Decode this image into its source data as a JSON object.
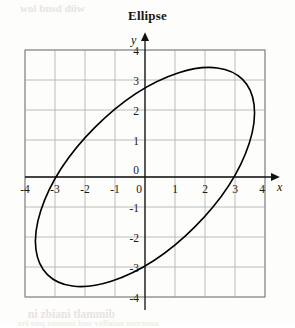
{
  "figure": {
    "title": "Ellipse",
    "background_color": "#fdfdfb",
    "bleed_text_top": "wol bnsd diiw",
    "bleed_text_bottom": "ni zbiani tlammib",
    "bleed_text_bottom2": "eri enq zuomez hne vellaine mernma"
  },
  "chart_data": {
    "type": "line",
    "title": "Ellipse",
    "xlabel": "x",
    "ylabel": "y",
    "xlim": [
      -4,
      4
    ],
    "ylim": [
      -4,
      4
    ],
    "grid": true,
    "grid_step": 1,
    "legend": "none",
    "axis_arrows": true,
    "xticks": [
      -4,
      -3,
      -2,
      -1,
      0,
      1,
      2,
      3,
      4
    ],
    "xtick_labels": [
      "-4",
      "-3",
      "-2",
      "-1",
      "0",
      "1",
      "2",
      "3",
      "4"
    ],
    "yticks": [
      -4,
      -3,
      -2,
      -1,
      0,
      1,
      2,
      3,
      4
    ],
    "ytick_labels": [
      "-4",
      "-3",
      "-2",
      "-1",
      "0",
      "1",
      "2",
      "3",
      "4"
    ],
    "curve_color": "#000000",
    "curve_width": 1.6,
    "series": [
      {
        "name": "Ellipse",
        "closed": true,
        "shape": "rotated-ellipse",
        "center": [
          0,
          0
        ],
        "semi_major": 4.6,
        "semi_minor": 2.35,
        "rotation_deg": 135,
        "extreme_points": {
          "top": [
            -1.7,
            3.45
          ],
          "bottom": [
            1.7,
            -3.45
          ],
          "left": [
            -3.2,
            1.7
          ],
          "right": [
            3.2,
            -1.7
          ]
        },
        "y_axis_crossings": [
          3.1,
          -3.1
        ],
        "x_axis_crossings": [
          -3.1,
          3.1
        ]
      }
    ]
  },
  "geometry": {
    "origin_px": [
      145,
      177
    ],
    "unit_px": 30,
    "grid_left_px": 25,
    "grid_top_px": 50,
    "grid_right_px": 265,
    "grid_bottom_px": 297
  }
}
